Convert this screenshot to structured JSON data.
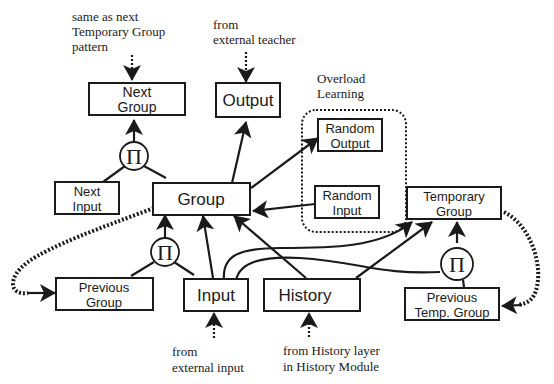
{
  "diagram": {
    "nodes": {
      "next_group": {
        "label1": "Next",
        "label2": "Group"
      },
      "output": {
        "label": "Output"
      },
      "random_output": {
        "label1": "Random",
        "label2": "Output"
      },
      "random_input": {
        "label1": "Random",
        "label2": "Input"
      },
      "next_input": {
        "label1": "Next",
        "label2": "Input"
      },
      "group": {
        "label": "Group"
      },
      "temporary_group": {
        "label1": "Temporary",
        "label2": "Group"
      },
      "previous_group": {
        "label1": "Previous",
        "label2": "Group"
      },
      "input": {
        "label": "Input"
      },
      "history": {
        "label": "History"
      },
      "previous_temp_group": {
        "label1": "Previous",
        "label2": "Temp. Group"
      }
    },
    "product_symbol": "Π",
    "overload_group": {
      "line1": "Overload",
      "line2": "Learning"
    },
    "annotations": {
      "next_group_source": {
        "line1": "same as next",
        "line2": "Temporary Group",
        "line3": "pattern"
      },
      "output_source": {
        "line1": "from",
        "line2": "external teacher"
      },
      "input_source": {
        "line1": "from",
        "line2": "external input"
      },
      "history_source": {
        "line1": "from History layer",
        "line2": "in History Module"
      }
    },
    "edges": [
      {
        "from": "annotation",
        "to": "Next Group",
        "style": "dotted-in"
      },
      {
        "from": "annotation",
        "to": "Output",
        "style": "dotted-in"
      },
      {
        "from": "annotation",
        "to": "Input",
        "style": "dotted-in"
      },
      {
        "from": "annotation",
        "to": "History",
        "style": "dotted-in"
      },
      {
        "from": "Group × Next Input (Π)",
        "to": "Next Group",
        "style": "solid"
      },
      {
        "from": "Group",
        "to": "Output",
        "style": "solid"
      },
      {
        "from": "Group",
        "to": "Random Output",
        "style": "solid"
      },
      {
        "from": "Random Input",
        "to": "Group",
        "style": "solid"
      },
      {
        "from": "Previous Group × Input (Π)",
        "to": "Group",
        "style": "solid"
      },
      {
        "from": "Input",
        "to": "Group",
        "style": "solid"
      },
      {
        "from": "History",
        "to": "Group",
        "style": "solid"
      },
      {
        "from": "Input",
        "to": "Temporary Group",
        "style": "solid"
      },
      {
        "from": "History",
        "to": "Temporary Group",
        "style": "solid"
      },
      {
        "from": "Input × Previous Temp. Group (Π)",
        "to": "Temporary Group",
        "style": "solid"
      },
      {
        "from": "Group",
        "to": "Previous Group",
        "style": "thick-dotted"
      },
      {
        "from": "Temporary Group",
        "to": "Previous Temp. Group",
        "style": "thick-dotted"
      }
    ]
  }
}
